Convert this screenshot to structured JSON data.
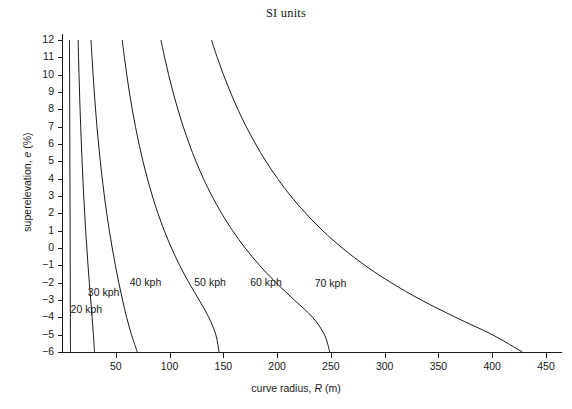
{
  "chart_data": {
    "type": "line",
    "title": "SI units",
    "xlabel": "curve radius, R (m)",
    "xlabel_parts": {
      "pre": "curve radius, ",
      "sym": "R",
      "post": " (m)"
    },
    "ylabel": "superelevation, e (%)",
    "ylabel_parts": {
      "pre": "superelevation, ",
      "sym": "e",
      "post": " (%)"
    },
    "xlim": [
      0,
      470
    ],
    "ylim": [
      -6,
      12
    ],
    "grid": false,
    "legend": "inline-curve-labels",
    "xticks": [
      50,
      100,
      150,
      200,
      250,
      300,
      350,
      400,
      450
    ],
    "xtick_labels": [
      "50",
      "100",
      "150",
      "200",
      "250",
      "300",
      "350",
      "400",
      "450"
    ],
    "yticks": [
      12,
      11,
      10,
      9,
      8,
      7,
      6,
      5,
      4,
      3,
      2,
      1,
      0,
      -1,
      -2,
      -3,
      -4,
      -5,
      -6
    ],
    "ytick_labels": [
      "12",
      "11",
      "10",
      "9",
      "8",
      "7",
      "6",
      "5",
      "4",
      "3",
      "2",
      "1",
      "0",
      "-1",
      "-2",
      "-3",
      "-4",
      "-5",
      "-6"
    ],
    "series": [
      {
        "name": "20 kph",
        "label": "20 kph",
        "label_x": 8,
        "label_y": -3.6,
        "e": [
          12,
          11,
          10,
          9,
          8,
          7,
          6,
          5,
          4,
          3,
          2,
          1,
          0,
          -1,
          -2,
          -3,
          -4,
          -5,
          -6
        ],
        "R": [
          7.0,
          7.0,
          7.1,
          7.1,
          7.2,
          7.2,
          7.3,
          7.3,
          7.4,
          7.4,
          7.5,
          7.5,
          7.6,
          7.6,
          7.7,
          7.7,
          7.8,
          7.8,
          7.9
        ]
      },
      {
        "name": "30 kph",
        "label": "30 kph",
        "label_x": 24,
        "label_y": -2.6,
        "e": [
          12,
          11,
          10,
          9,
          8,
          7,
          6,
          5,
          4,
          3,
          2,
          1,
          0,
          -1,
          -2,
          -3,
          -4,
          -5,
          -6
        ],
        "R": [
          15.0,
          15.4,
          15.8,
          16.3,
          16.8,
          17.4,
          18.0,
          18.7,
          19.4,
          20.2,
          21.1,
          22.0,
          23.1,
          24.2,
          25.4,
          26.7,
          28.0,
          29.2,
          30.2
        ]
      },
      {
        "name": "40 kph",
        "label": "40 kph",
        "label_x": 63,
        "label_y": -2.0,
        "e": [
          12,
          11,
          10,
          9,
          8,
          7,
          6,
          5,
          4,
          3,
          2,
          1,
          0,
          -1,
          -2,
          -3,
          -4,
          -5,
          -6
        ],
        "R": [
          27.0,
          27.9,
          28.9,
          30.0,
          31.2,
          32.5,
          34.0,
          35.6,
          37.4,
          39.4,
          41.6,
          44.0,
          46.7,
          49.6,
          52.8,
          56.3,
          60.1,
          64.6,
          70.0
        ]
      },
      {
        "name": "50 kph",
        "label": "50 kph",
        "label_x": 123,
        "label_y": -2.0,
        "e": [
          12,
          11,
          10,
          9,
          8,
          7,
          6,
          5,
          4,
          3,
          2,
          1,
          0,
          -1,
          -2,
          -3,
          -4,
          -5,
          -6
        ],
        "R": [
          56.0,
          58.0,
          60.2,
          62.6,
          65.3,
          68.3,
          71.6,
          75.3,
          79.4,
          84.0,
          89.2,
          95.1,
          101.8,
          109.4,
          118.0,
          127.5,
          136.5,
          143.0,
          146.0
        ]
      },
      {
        "name": "60 kph",
        "label": "60 kph",
        "label_x": 175,
        "label_y": -2.0,
        "e": [
          12,
          11,
          10,
          9,
          8,
          7,
          6,
          5,
          4,
          3,
          2,
          1,
          0,
          -1,
          -2,
          -3,
          -4,
          -5,
          -6
        ],
        "R": [
          92.0,
          95.4,
          99.1,
          103.2,
          107.7,
          112.7,
          118.3,
          124.5,
          131.5,
          139.4,
          148.4,
          158.6,
          170.3,
          183.7,
          199.0,
          216.0,
          233.0,
          244.0,
          249.0
        ]
      },
      {
        "name": "70 kph",
        "label": "70 kph",
        "label_x": 235,
        "label_y": -2.1,
        "e": [
          12,
          11,
          10,
          9,
          8,
          7,
          6,
          5,
          4,
          3,
          2,
          1,
          0,
          -1,
          -2,
          -3,
          -4,
          -5,
          -6
        ],
        "R": [
          139.0,
          144.3,
          150.1,
          156.5,
          163.5,
          171.3,
          180.0,
          189.6,
          200.5,
          212.7,
          226.6,
          242.4,
          260.6,
          281.6,
          306.0,
          334.0,
          366.0,
          400.0,
          428.0
        ]
      }
    ]
  },
  "axes_geometry": {
    "plot_left_px": 62,
    "plot_right_px": 562,
    "plot_top_px": 40,
    "plot_bottom_px": 352,
    "x_px_per_unit": 1.0755,
    "y_px_per_unit": 17.333
  }
}
